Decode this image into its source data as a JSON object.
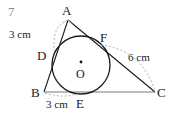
{
  "figure": {
    "problem_number": "7",
    "colors": {
      "stroke": "#1a1a1a",
      "dashed": "#9a9a9a",
      "base_line": "#7a7a7a",
      "background": "#ffffff",
      "number": "#8c8c8c"
    },
    "vertices": [
      {
        "name": "A",
        "label": "A",
        "x": 68,
        "y": 20,
        "label_x": 62,
        "label_y": 4
      },
      {
        "name": "B",
        "label": "B",
        "x": 44,
        "y": 92,
        "label_x": 31,
        "label_y": 86
      },
      {
        "name": "C",
        "label": "C",
        "x": 155,
        "y": 92,
        "label_x": 157,
        "label_y": 86
      }
    ],
    "tangent_points": [
      {
        "name": "D",
        "label": "D",
        "x": 55,
        "y": 55,
        "label_x": 37,
        "label_y": 49
      },
      {
        "name": "F",
        "label": "F",
        "x": 101,
        "y": 45,
        "label_x": 100,
        "label_y": 31
      },
      {
        "name": "E",
        "label": "E",
        "x": 81,
        "y": 92,
        "label_x": 76,
        "label_y": 97
      }
    ],
    "incircle": {
      "center_label": "O",
      "cx": 81,
      "cy": 65,
      "r": 29,
      "center_label_x": 76,
      "center_label_y": 68
    },
    "measures": [
      {
        "name": "AD",
        "text": "3 cm",
        "x": 9,
        "y": 29
      },
      {
        "name": "BE",
        "text": "3 cm",
        "x": 46,
        "y": 99
      },
      {
        "name": "FC",
        "text": "6 cm",
        "x": 128,
        "y": 52
      }
    ]
  }
}
